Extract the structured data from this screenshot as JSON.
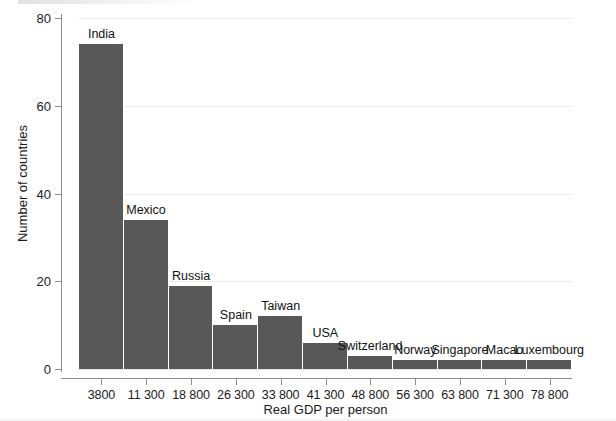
{
  "chart_data": {
    "type": "bar",
    "title": "",
    "subtitle": "",
    "xlabel": "Real GDP per person",
    "ylabel": "Number of countries",
    "xlim": [
      0,
      11
    ],
    "ylim": [
      0,
      80
    ],
    "grid": true,
    "legend": null,
    "y_ticks": [
      0,
      20,
      40,
      60,
      80
    ],
    "y_tick_labels": [
      "0",
      "20",
      "40",
      "60",
      "80"
    ],
    "x_tick_labels": [
      "3800",
      "11 300",
      "18 800",
      "26 300",
      "33 800",
      "41 300",
      "48 800",
      "56 300",
      "63 800",
      "71 300",
      "78 800"
    ],
    "bar_color": "#585858",
    "categories": [
      "3800",
      "11 300",
      "18 800",
      "26 300",
      "33 800",
      "41 300",
      "48 800",
      "56 300",
      "63 800",
      "71 300",
      "78 800"
    ],
    "values": [
      74,
      34,
      19,
      10,
      12,
      6,
      3,
      2,
      2,
      2,
      2
    ],
    "annotations": [
      "India",
      "Mexico",
      "Russia",
      "Spain",
      "Taiwan",
      "USA",
      "Switzerland",
      "Norway",
      "Singapore",
      "Macao",
      "Luxembourg"
    ],
    "bars": [
      {
        "bin": "3800",
        "label": "India",
        "value": 74
      },
      {
        "bin": "11 300",
        "label": "Mexico",
        "value": 34
      },
      {
        "bin": "18 800",
        "label": "Russia",
        "value": 19
      },
      {
        "bin": "26 300",
        "label": "Spain",
        "value": 10
      },
      {
        "bin": "33 800",
        "label": "Taiwan",
        "value": 12
      },
      {
        "bin": "41 300",
        "label": "USA",
        "value": 6
      },
      {
        "bin": "48 800",
        "label": "Switzerland",
        "value": 3
      },
      {
        "bin": "56 300",
        "label": "Norway",
        "value": 2
      },
      {
        "bin": "63 800",
        "label": "Singapore",
        "value": 2
      },
      {
        "bin": "71 300",
        "label": "Macao",
        "value": 2
      },
      {
        "bin": "78 800",
        "label": "Luxembourg",
        "value": 2
      }
    ]
  },
  "axes": {
    "y_title": "Number of countries",
    "x_title": "Real GDP per person"
  }
}
